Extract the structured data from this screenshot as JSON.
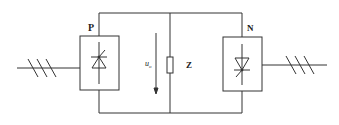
{
  "diagram": {
    "labels": {
      "left_converter": "P",
      "right_converter": "N",
      "load": "Z",
      "voltage": "u",
      "voltage_sub": "o"
    },
    "components": [
      {
        "id": "left-three-phase-input",
        "type": "three-phase-line"
      },
      {
        "id": "converter-p",
        "type": "thyristor-converter",
        "label": "P"
      },
      {
        "id": "load-z",
        "type": "resistor",
        "label": "Z"
      },
      {
        "id": "voltage-arrow",
        "type": "arrow",
        "label": "u_o"
      },
      {
        "id": "converter-n",
        "type": "thyristor-converter",
        "label": "N"
      },
      {
        "id": "right-three-phase-input",
        "type": "three-phase-line"
      }
    ],
    "colors": {
      "stroke": "#333333",
      "background": "#ffffff"
    }
  }
}
